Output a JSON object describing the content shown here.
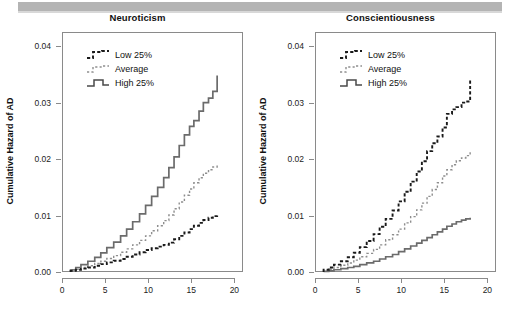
{
  "figure": {
    "background": "#ffffff",
    "banner_color": "#b4b4b4"
  },
  "chart_data": [
    {
      "type": "line",
      "title": "Neuroticism",
      "xlabel": "",
      "ylabel": "Cumulative Hazard of AD",
      "xlim": [
        0,
        21
      ],
      "ylim": [
        0,
        0.0425
      ],
      "xticks": [
        0,
        5,
        10,
        15,
        20
      ],
      "yticks": [
        0.0,
        0.01,
        0.02,
        0.03,
        0.04
      ],
      "ytick_labels": [
        "0.00",
        "0.01",
        "0.02",
        "0.03",
        "0.04"
      ],
      "xtick_labels": [
        "0",
        "5",
        "10",
        "15",
        "20"
      ],
      "grid": false,
      "legend_position": "upper left",
      "style": "step",
      "series": [
        {
          "name": "Low 25%",
          "line_style": "dashed",
          "color": "#1a1a1a",
          "x": [
            1.0,
            1.6,
            2.2,
            3.0,
            3.8,
            4.5,
            5.2,
            6.0,
            6.8,
            7.5,
            8.2,
            9.0,
            9.7,
            10.4,
            11.1,
            11.8,
            12.4,
            13.0,
            13.6,
            14.2,
            14.8,
            15.3,
            15.9,
            16.4,
            17.0,
            17.5,
            18.0
          ],
          "y": [
            0.0002,
            0.0004,
            0.0006,
            0.0008,
            0.0011,
            0.0014,
            0.0017,
            0.002,
            0.0023,
            0.0027,
            0.0031,
            0.0035,
            0.0039,
            0.0042,
            0.0045,
            0.0048,
            0.0052,
            0.0058,
            0.0064,
            0.007,
            0.0076,
            0.0082,
            0.0087,
            0.0092,
            0.0096,
            0.0099,
            0.0102
          ]
        },
        {
          "name": "Average",
          "line_style": "dotted",
          "color": "#8e8e8e",
          "x": [
            1.0,
            1.6,
            2.2,
            3.0,
            3.8,
            4.5,
            5.2,
            6.0,
            6.8,
            7.5,
            8.2,
            9.0,
            9.7,
            10.4,
            11.1,
            11.8,
            12.4,
            13.0,
            13.6,
            14.2,
            14.8,
            15.3,
            15.9,
            16.4,
            17.0,
            17.5,
            18.0
          ],
          "y": [
            0.0003,
            0.0005,
            0.0008,
            0.0011,
            0.0015,
            0.0019,
            0.0024,
            0.0029,
            0.0035,
            0.0041,
            0.0048,
            0.0056,
            0.0064,
            0.0073,
            0.0082,
            0.0091,
            0.0101,
            0.0112,
            0.0124,
            0.0136,
            0.0147,
            0.0158,
            0.0167,
            0.0175,
            0.0181,
            0.0186,
            0.019
          ]
        },
        {
          "name": "High 25%",
          "line_style": "solid",
          "color": "#6b6b6b",
          "x": [
            1.0,
            1.6,
            2.2,
            3.0,
            3.8,
            4.5,
            5.2,
            6.0,
            6.8,
            7.5,
            8.2,
            9.0,
            9.7,
            10.4,
            11.1,
            11.8,
            12.4,
            13.0,
            13.6,
            14.2,
            14.8,
            15.3,
            15.9,
            16.4,
            17.0,
            17.5,
            18.0
          ],
          "y": [
            0.0004,
            0.0008,
            0.0013,
            0.0019,
            0.0026,
            0.0034,
            0.0043,
            0.0053,
            0.0064,
            0.0076,
            0.0089,
            0.0103,
            0.0118,
            0.0134,
            0.015,
            0.0167,
            0.0185,
            0.0204,
            0.0224,
            0.0243,
            0.0258,
            0.0268,
            0.0285,
            0.03,
            0.0308,
            0.032,
            0.0348
          ]
        }
      ]
    },
    {
      "type": "line",
      "title": "Conscientiousness",
      "xlabel": "",
      "ylabel": "Cumulative Hazard of AD",
      "xlim": [
        0,
        21
      ],
      "ylim": [
        0,
        0.0425
      ],
      "xticks": [
        0,
        5,
        10,
        15,
        20
      ],
      "yticks": [
        0.0,
        0.01,
        0.02,
        0.03,
        0.04
      ],
      "ytick_labels": [
        "0.00",
        "0.01",
        "0.02",
        "0.03",
        "0.04"
      ],
      "xtick_labels": [
        "0",
        "5",
        "10",
        "15",
        "20"
      ],
      "grid": false,
      "legend_position": "upper left",
      "style": "step",
      "series": [
        {
          "name": "Low 25%",
          "line_style": "dashed",
          "color": "#1a1a1a",
          "x": [
            1.0,
            1.6,
            2.2,
            3.0,
            3.8,
            4.5,
            5.2,
            6.0,
            6.8,
            7.5,
            8.2,
            9.0,
            9.7,
            10.4,
            11.1,
            11.8,
            12.4,
            13.0,
            13.6,
            14.2,
            14.8,
            15.3,
            15.9,
            16.4,
            17.0,
            17.5,
            18.0
          ],
          "y": [
            0.0004,
            0.0008,
            0.0013,
            0.0019,
            0.0026,
            0.0034,
            0.0044,
            0.0055,
            0.0067,
            0.008,
            0.0094,
            0.0109,
            0.0125,
            0.0142,
            0.016,
            0.0178,
            0.0196,
            0.0214,
            0.0228,
            0.024,
            0.0256,
            0.028,
            0.0288,
            0.0292,
            0.03,
            0.0302,
            0.034
          ]
        },
        {
          "name": "Average",
          "line_style": "dotted",
          "color": "#8e8e8e",
          "x": [
            1.0,
            1.6,
            2.2,
            3.0,
            3.8,
            4.5,
            5.2,
            6.0,
            6.8,
            7.5,
            8.2,
            9.0,
            9.7,
            10.4,
            11.1,
            11.8,
            12.4,
            13.0,
            13.6,
            14.2,
            14.8,
            15.3,
            15.9,
            16.4,
            17.0,
            17.5,
            18.0
          ],
          "y": [
            0.0003,
            0.0005,
            0.0008,
            0.0012,
            0.0016,
            0.0021,
            0.0027,
            0.0033,
            0.004,
            0.0048,
            0.0057,
            0.0066,
            0.0076,
            0.0087,
            0.0098,
            0.011,
            0.0122,
            0.0134,
            0.0146,
            0.0158,
            0.017,
            0.0181,
            0.019,
            0.0197,
            0.0202,
            0.0206,
            0.0215
          ]
        },
        {
          "name": "High 25%",
          "line_style": "solid",
          "color": "#6b6b6b",
          "x": [
            1.0,
            1.6,
            2.2,
            3.0,
            3.8,
            4.5,
            5.2,
            6.0,
            6.8,
            7.5,
            8.2,
            9.0,
            9.7,
            10.4,
            11.1,
            11.8,
            12.4,
            13.0,
            13.6,
            14.2,
            14.8,
            15.3,
            15.9,
            16.4,
            17.0,
            17.5,
            18.0
          ],
          "y": [
            0.0001,
            0.0002,
            0.0004,
            0.0006,
            0.0008,
            0.001,
            0.0013,
            0.0016,
            0.0019,
            0.0023,
            0.0027,
            0.0031,
            0.0036,
            0.0041,
            0.0046,
            0.0051,
            0.0056,
            0.0061,
            0.0066,
            0.0071,
            0.0076,
            0.0081,
            0.0085,
            0.0089,
            0.0092,
            0.0094,
            0.0096
          ]
        }
      ]
    }
  ]
}
